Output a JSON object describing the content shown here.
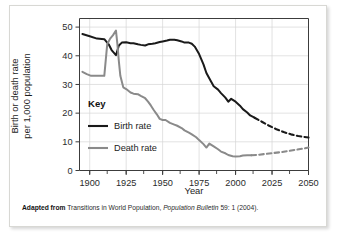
{
  "figure": {
    "caption_prefix": "Adapted from",
    "caption_body": "Transitions in World Population,",
    "caption_italic": "Population Bulletin",
    "caption_suffix": "59: 1 (2004)."
  },
  "chart_data": {
    "type": "line",
    "title": "",
    "xlabel": "Year",
    "ylabel": "Birth or death rate\nper 1,000 population",
    "ylabel_line1": "Birth or death rate",
    "ylabel_line2": "per 1,000 population",
    "xlim": [
      1893,
      2050
    ],
    "ylim": [
      0,
      53
    ],
    "xticks": [
      1900,
      1925,
      1950,
      1975,
      2000,
      2025,
      2050
    ],
    "xtick_labels": [
      "1900",
      "1925",
      "1950",
      "1975",
      "2000",
      "2025",
      "2050"
    ],
    "xminor_ticks": [
      1900,
      1912,
      1925,
      1937,
      1950,
      1962,
      1975,
      1987,
      2000,
      2012,
      2025,
      2037,
      2050
    ],
    "yticks": [
      0,
      10,
      20,
      30,
      40,
      50
    ],
    "ytick_labels": [
      "0",
      "10",
      "20",
      "30",
      "40",
      "50"
    ],
    "grid": true,
    "legend_position": "inside-left",
    "legend_title": "Key",
    "series": [
      {
        "name": "Birth rate",
        "color": "#1a1a1a",
        "style": "solid",
        "x": [
          1895,
          1900,
          1905,
          1910,
          1913,
          1915,
          1918,
          1920,
          1922,
          1925,
          1928,
          1930,
          1933,
          1935,
          1938,
          1940,
          1943,
          1945,
          1948,
          1950,
          1953,
          1955,
          1958,
          1960,
          1963,
          1965,
          1968,
          1970,
          1972,
          1975,
          1978,
          1980,
          1983,
          1985,
          1988,
          1990,
          1993,
          1995,
          1997,
          2000,
          2003,
          2005,
          2008,
          2010,
          2013
        ],
        "y": [
          47.6,
          46.8,
          46.0,
          45.8,
          44.0,
          42.0,
          40.2,
          43.6,
          44.6,
          44.7,
          44.4,
          44.4,
          44.0,
          43.8,
          43.6,
          44.0,
          44.2,
          44.4,
          44.8,
          45.0,
          45.3,
          45.6,
          45.6,
          45.4,
          45.0,
          44.6,
          44.6,
          44.2,
          43.2,
          40.6,
          37.0,
          34.0,
          31.2,
          29.4,
          28.2,
          27.0,
          25.4,
          24.0,
          25.0,
          24.0,
          22.6,
          21.4,
          20.2,
          19.2,
          18.4
        ]
      },
      {
        "name": "Birth rate (projected)",
        "color": "#1a1a1a",
        "style": "dashed",
        "x": [
          2013,
          2018,
          2023,
          2028,
          2033,
          2038,
          2043,
          2050
        ],
        "y": [
          18.4,
          17.0,
          15.6,
          14.4,
          13.4,
          12.6,
          12.0,
          11.5
        ]
      },
      {
        "name": "Death rate",
        "color": "#8a8a8a",
        "style": "solid",
        "x": [
          1895,
          1898,
          1901,
          1904,
          1907,
          1910,
          1912,
          1914,
          1916,
          1918,
          1919,
          1920,
          1921,
          1923,
          1925,
          1928,
          1930,
          1933,
          1935,
          1938,
          1940,
          1942,
          1944,
          1946,
          1948,
          1950,
          1952,
          1955,
          1958,
          1960,
          1963,
          1965,
          1968,
          1970,
          1973,
          1975,
          1978,
          1980,
          1982,
          1985,
          1988,
          1990,
          1993,
          1995,
          1998,
          2000,
          2003,
          2005,
          2008,
          2011
        ],
        "y": [
          34.4,
          33.6,
          33.0,
          33.0,
          33.0,
          33.0,
          44.0,
          46.0,
          47.2,
          48.8,
          44.0,
          38.0,
          33.0,
          29.0,
          28.4,
          27.2,
          26.8,
          26.6,
          26.0,
          25.2,
          24.0,
          22.6,
          21.0,
          19.6,
          18.0,
          17.6,
          17.6,
          16.6,
          16.0,
          15.6,
          14.8,
          14.0,
          13.2,
          12.6,
          11.6,
          10.6,
          9.2,
          8.0,
          9.4,
          8.4,
          7.4,
          6.6,
          6.0,
          5.4,
          5.0,
          4.9,
          5.0,
          5.2,
          5.3,
          5.3
        ]
      },
      {
        "name": "Death rate (projected)",
        "color": "#8a8a8a",
        "style": "dashed",
        "x": [
          2011,
          2016,
          2021,
          2026,
          2031,
          2036,
          2041,
          2046,
          2050
        ],
        "y": [
          5.3,
          5.5,
          5.8,
          6.1,
          6.4,
          6.8,
          7.2,
          7.6,
          8.0
        ]
      }
    ],
    "legend_entries": [
      {
        "label": "Birth rate",
        "color": "#1a1a1a"
      },
      {
        "label": "Death rate",
        "color": "#8a8a8a"
      }
    ]
  },
  "colors": {
    "birth_rate": "#1a1a1a",
    "death_rate": "#8a8a8a",
    "grid": "#d6d6d6",
    "axis": "#3c3c3c",
    "background": "#ffffff"
  }
}
